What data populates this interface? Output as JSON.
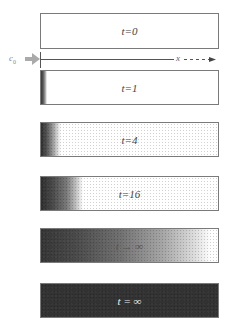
{
  "figure": {
    "source_label": {
      "symbol": "c",
      "subscript": "0"
    },
    "axis_label": "x",
    "panels": [
      {
        "label": "t=0",
        "fill": "none"
      },
      {
        "label": "t=1",
        "fill": "thin dark band at left edge"
      },
      {
        "label": "t=4",
        "fill": "dark gradient to ~10% width"
      },
      {
        "label": "t=16",
        "fill": "dark gradient to ~23% width"
      },
      {
        "label": "t → ∞",
        "fill": "gradient across nearly full width"
      },
      {
        "label": "t = ∞",
        "fill": "uniform dark"
      }
    ]
  }
}
